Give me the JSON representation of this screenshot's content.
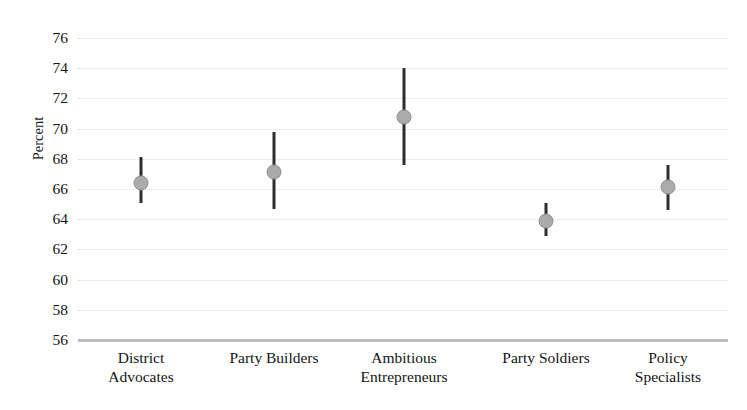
{
  "chart_data": {
    "type": "scatter",
    "title": "",
    "xlabel": "",
    "ylabel": "Percent",
    "ylim": [
      56,
      76
    ],
    "ytick_step": 2,
    "ytick_labels": [
      "76",
      "74",
      "72",
      "70",
      "68",
      "66",
      "64",
      "62",
      "60",
      "58",
      "56"
    ],
    "grid": true,
    "legend": false,
    "error_bars": "vertical confidence intervals",
    "marker": {
      "shape": "circle",
      "fill_color": "#ababab",
      "edge_color": "#8e8e8e"
    },
    "errorbar_color": "#2e2e2e",
    "gridline_color": "#dedede",
    "axis_color": "#bdbdbd",
    "categories": [
      "District\nAdvocates",
      "Party Builders",
      "Ambitious\nEntrepreneurs",
      "Party Soldiers",
      "Policy\nSpecialists"
    ],
    "values": [
      66.4,
      67.1,
      70.8,
      63.9,
      66.1
    ],
    "ci_low": [
      65.1,
      64.7,
      67.6,
      62.9,
      64.6
    ],
    "ci_high": [
      68.1,
      69.8,
      74.0,
      65.1,
      67.6
    ],
    "points": [
      {
        "category": "District Advocates",
        "value": 66.4,
        "ci_low": 65.1,
        "ci_high": 68.1
      },
      {
        "category": "Party Builders",
        "value": 67.1,
        "ci_low": 64.7,
        "ci_high": 69.8
      },
      {
        "category": "Ambitious Entrepreneurs",
        "value": 70.8,
        "ci_low": 67.6,
        "ci_high": 74.0
      },
      {
        "category": "Party Soldiers",
        "value": 63.9,
        "ci_low": 62.9,
        "ci_high": 65.1
      },
      {
        "category": "Policy Specialists",
        "value": 66.1,
        "ci_low": 64.6,
        "ci_high": 67.6
      }
    ]
  }
}
